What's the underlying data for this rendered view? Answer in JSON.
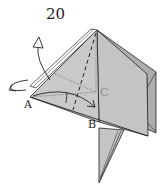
{
  "diagram": {
    "step_number": "20",
    "labels": {
      "a": "A",
      "b": "B",
      "c": "C"
    },
    "colors": {
      "paper": "#c4c4c4",
      "paper_dark": "#adadad",
      "paper_light": "#d6d6d6",
      "outline": "#222222",
      "white_flap": "#ffffff"
    },
    "symbols": [
      "mountain-fold-arrow",
      "turn-over-arrow",
      "valley-fold-line",
      "crease-lines",
      "fold-arrow-A-to-B"
    ]
  }
}
